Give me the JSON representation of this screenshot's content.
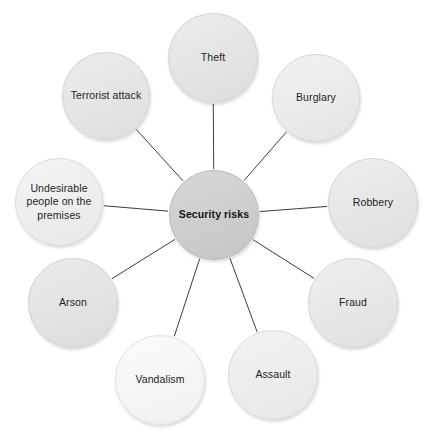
{
  "diagram": {
    "type": "radial-spoke-diagram",
    "title": "Security risks",
    "canvas": {
      "width": 429,
      "height": 435,
      "background": "#ffffff"
    },
    "center": {
      "id": "security-risks",
      "label": "Security risks",
      "cx": 214,
      "cy": 215,
      "r": 45,
      "fill_top": "#d8d8d8",
      "fill_bottom": "#c4c4c4",
      "border": "#b9b9b9",
      "bold": true
    },
    "link_color": "#3c3c3c",
    "link_width": 1,
    "nodes": [
      {
        "id": "theft",
        "label": "Theft",
        "cx": 213,
        "cy": 58,
        "r": 45,
        "fill_top": "#ededed",
        "fill_bottom": "#dcdcdc",
        "border": "#d2d2d2"
      },
      {
        "id": "burglary",
        "label": "Burglary",
        "cx": 316,
        "cy": 98,
        "r": 44,
        "fill_top": "#f2f2f2",
        "fill_bottom": "#e4e4e4",
        "border": "#d6d6d6"
      },
      {
        "id": "robbery",
        "label": "Robbery",
        "cx": 373,
        "cy": 203,
        "r": 45,
        "fill_top": "#eeeeee",
        "fill_bottom": "#dfdfdf",
        "border": "#d2d2d2"
      },
      {
        "id": "fraud",
        "label": "Fraud",
        "cx": 353,
        "cy": 303,
        "r": 45,
        "fill_top": "#efefef",
        "fill_bottom": "#e0e0e0",
        "border": "#d3d3d3"
      },
      {
        "id": "assault",
        "label": "Assault",
        "cx": 273,
        "cy": 375,
        "r": 45,
        "fill_top": "#f3f3f3",
        "fill_bottom": "#e7e7e7",
        "border": "#d9d9d9"
      },
      {
        "id": "vandalism",
        "label": "Vandalism",
        "cx": 160,
        "cy": 380,
        "r": 45,
        "fill_top": "#fbfbfb",
        "fill_bottom": "#f0f0f0",
        "border": "#e0e0e0"
      },
      {
        "id": "arson",
        "label": "Arson",
        "cx": 73,
        "cy": 303,
        "r": 45,
        "fill_top": "#ebebeb",
        "fill_bottom": "#dcdcdc",
        "border": "#d0d0d0"
      },
      {
        "id": "undesirable-people",
        "label": "Undesirable people on the premises",
        "cx": 59,
        "cy": 202,
        "r": 44,
        "fill_top": "#f4f4f4",
        "fill_bottom": "#e8e8e8",
        "border": "#dadada"
      },
      {
        "id": "terrorist-attack",
        "label": "Terrorist attack",
        "cx": 106,
        "cy": 96,
        "r": 44,
        "fill_top": "#ececec",
        "fill_bottom": "#dedede",
        "border": "#d2d2d2"
      }
    ]
  }
}
